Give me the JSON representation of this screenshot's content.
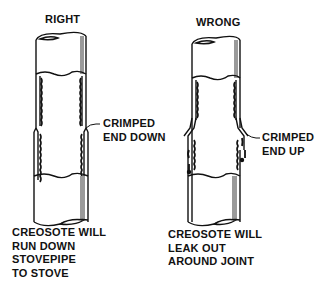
{
  "diagram": {
    "left": {
      "heading": "RIGHT",
      "callout": [
        "CRIMPED",
        "END DOWN"
      ],
      "caption": [
        "CREOSOTE WILL",
        "RUN DOWN",
        "STOVEPIPE",
        "TO STOVE"
      ]
    },
    "right": {
      "heading": "WRONG",
      "callout": [
        "CRIMPED",
        "END UP"
      ],
      "caption": [
        "CREOSOTE WILL",
        "LEAK OUT",
        "AROUND JOINT"
      ]
    },
    "colors": {
      "ink": "#111111",
      "background": "#ffffff",
      "shade": "#9a9a9a"
    }
  }
}
